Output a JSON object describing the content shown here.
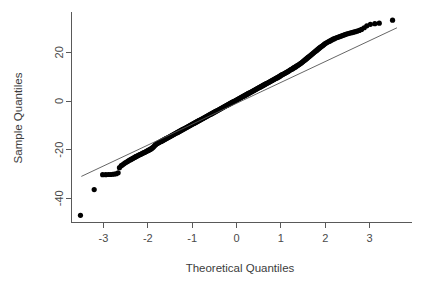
{
  "figure": {
    "kind": "normal-qq-plot",
    "width": 427,
    "height": 289,
    "background": "#ffffff",
    "point_color": "#000000",
    "line_color": "#555555",
    "axis_color": "#595959",
    "text_color": "#3c3c3c"
  },
  "chart_data": {
    "type": "scatter",
    "title": "",
    "subtitle": "",
    "xlabel": "Theoretical Quantiles",
    "ylabel": "Sample Quantiles",
    "xlim": [
      -3.85,
      3.95
    ],
    "ylim": [
      -50.5,
      36.5
    ],
    "xticks": [
      -3,
      -2,
      -1,
      0,
      1,
      2,
      3
    ],
    "xticklabels": [
      "-3",
      "-2",
      "-1",
      "0",
      "1",
      "2",
      "3"
    ],
    "yticks": [
      20,
      0,
      -20,
      -40
    ],
    "yticklabels": [
      "20",
      "0",
      "-20",
      "-40"
    ],
    "grid": false,
    "legend": null,
    "annotations": [],
    "reference_line": {
      "name": "qqline",
      "x": [
        -3.5,
        3.62
      ],
      "y": [
        -31.0,
        30.1
      ],
      "slope": 8.58,
      "intercept": -1.0,
      "style": "solid-thin"
    },
    "series": [
      {
        "name": "Sample quantiles vs theoretical quantiles",
        "marker": "filled-circle",
        "marker_size": 2.6,
        "x": [
          -3.52,
          -3.21,
          -3.02,
          -2.95,
          -2.89,
          -2.84,
          -2.79,
          -2.75,
          -2.71,
          -2.67,
          -2.64,
          -2.6,
          -2.57,
          -2.54,
          -2.51,
          -2.48,
          -2.45,
          -2.43,
          -2.4,
          -2.38,
          -2.35,
          -2.33,
          -2.3,
          -2.28,
          -2.26,
          -2.24,
          -2.22,
          -2.2,
          -2.18,
          -2.16,
          -2.14,
          -2.12,
          -2.1,
          -2.08,
          -2.06,
          -2.04,
          -2.02,
          -2.0,
          -1.98,
          -1.96,
          -1.94,
          -1.92,
          -1.9,
          -1.88,
          -1.86,
          -1.84,
          -1.82,
          -1.8,
          -1.78,
          -1.76,
          -1.74,
          -1.72,
          -1.7,
          -1.68,
          -1.66,
          -1.64,
          -1.62,
          -1.6,
          -1.58,
          -1.56,
          -1.54,
          -1.52,
          -1.5,
          -1.48,
          -1.46,
          -1.44,
          -1.42,
          -1.4,
          -1.38,
          -1.36,
          -1.34,
          -1.32,
          -1.3,
          -1.28,
          -1.26,
          -1.24,
          -1.22,
          -1.2,
          -1.18,
          -1.16,
          -1.14,
          -1.12,
          -1.1,
          -1.08,
          -1.06,
          -1.04,
          -1.02,
          -1.0,
          -0.98,
          -0.96,
          -0.94,
          -0.92,
          -0.9,
          -0.88,
          -0.86,
          -0.84,
          -0.82,
          -0.8,
          -0.78,
          -0.76,
          -0.74,
          -0.72,
          -0.7,
          -0.68,
          -0.66,
          -0.64,
          -0.62,
          -0.6,
          -0.58,
          -0.56,
          -0.54,
          -0.52,
          -0.5,
          -0.48,
          -0.46,
          -0.44,
          -0.42,
          -0.4,
          -0.38,
          -0.36,
          -0.34,
          -0.32,
          -0.3,
          -0.28,
          -0.26,
          -0.24,
          -0.22,
          -0.2,
          -0.18,
          -0.16,
          -0.14,
          -0.12,
          -0.1,
          -0.08,
          -0.06,
          -0.04,
          -0.02,
          0.0,
          0.02,
          0.04,
          0.06,
          0.08,
          0.1,
          0.12,
          0.14,
          0.16,
          0.18,
          0.2,
          0.22,
          0.24,
          0.26,
          0.28,
          0.3,
          0.32,
          0.34,
          0.36,
          0.38,
          0.4,
          0.42,
          0.44,
          0.46,
          0.48,
          0.5,
          0.52,
          0.54,
          0.56,
          0.58,
          0.6,
          0.62,
          0.64,
          0.66,
          0.68,
          0.7,
          0.72,
          0.74,
          0.76,
          0.78,
          0.8,
          0.82,
          0.84,
          0.86,
          0.88,
          0.9,
          0.92,
          0.94,
          0.96,
          0.98,
          1.0,
          1.02,
          1.04,
          1.06,
          1.08,
          1.1,
          1.12,
          1.14,
          1.16,
          1.18,
          1.2,
          1.22,
          1.24,
          1.26,
          1.28,
          1.3,
          1.32,
          1.34,
          1.36,
          1.38,
          1.4,
          1.42,
          1.44,
          1.46,
          1.48,
          1.5,
          1.52,
          1.54,
          1.56,
          1.58,
          1.6,
          1.62,
          1.64,
          1.66,
          1.68,
          1.7,
          1.72,
          1.74,
          1.76,
          1.78,
          1.8,
          1.82,
          1.84,
          1.86,
          1.88,
          1.9,
          1.92,
          1.94,
          1.96,
          1.98,
          2.0,
          2.03,
          2.06,
          2.09,
          2.12,
          2.15,
          2.18,
          2.21,
          2.24,
          2.27,
          2.3,
          2.33,
          2.36,
          2.39,
          2.42,
          2.45,
          2.48,
          2.52,
          2.56,
          2.6,
          2.64,
          2.68,
          2.72,
          2.77,
          2.82,
          2.88,
          2.94,
          3.02,
          3.12,
          3.22,
          3.52
        ],
        "y": [
          -47.0,
          -36.4,
          -30.3,
          -30.3,
          -30.2,
          -30.2,
          -30.1,
          -30.0,
          -29.9,
          -29.5,
          -27.4,
          -26.6,
          -26.2,
          -25.8,
          -25.4,
          -25.1,
          -24.8,
          -24.5,
          -24.2,
          -24.0,
          -23.7,
          -23.5,
          -23.2,
          -23.0,
          -22.8,
          -22.6,
          -22.4,
          -22.2,
          -22.0,
          -21.9,
          -21.7,
          -21.5,
          -21.3,
          -21.2,
          -21.0,
          -20.8,
          -20.6,
          -20.4,
          -20.2,
          -20.0,
          -19.8,
          -19.6,
          -19.3,
          -19.0,
          -18.6,
          -18.2,
          -17.9,
          -17.6,
          -17.4,
          -17.2,
          -17.0,
          -16.8,
          -16.6,
          -16.4,
          -16.2,
          -16.0,
          -15.8,
          -15.6,
          -15.4,
          -15.2,
          -15.0,
          -14.8,
          -14.6,
          -14.4,
          -14.2,
          -14.0,
          -13.8,
          -13.6,
          -13.4,
          -13.2,
          -13.0,
          -12.8,
          -12.6,
          -12.4,
          -12.2,
          -12.0,
          -11.8,
          -11.6,
          -11.4,
          -11.2,
          -11.0,
          -10.8,
          -10.6,
          -10.4,
          -10.2,
          -10.0,
          -9.8,
          -9.6,
          -9.4,
          -9.2,
          -9.0,
          -8.8,
          -8.6,
          -8.4,
          -8.2,
          -8.0,
          -7.8,
          -7.6,
          -7.4,
          -7.2,
          -7.0,
          -6.8,
          -6.6,
          -6.4,
          -6.2,
          -6.0,
          -5.8,
          -5.6,
          -5.4,
          -5.2,
          -5.0,
          -4.8,
          -4.6,
          -4.4,
          -4.2,
          -4.0,
          -3.8,
          -3.6,
          -3.4,
          -3.2,
          -3.0,
          -2.8,
          -2.6,
          -2.4,
          -2.2,
          -2.0,
          -1.8,
          -1.6,
          -1.4,
          -1.2,
          -1.0,
          -0.8,
          -0.6,
          -0.4,
          -0.2,
          0.0,
          0.2,
          0.4,
          0.6,
          0.8,
          1.0,
          1.2,
          1.4,
          1.6,
          1.8,
          2.0,
          2.2,
          2.4,
          2.6,
          2.8,
          3.0,
          3.2,
          3.4,
          3.6,
          3.8,
          4.0,
          4.2,
          4.4,
          4.6,
          4.8,
          5.0,
          5.2,
          5.4,
          5.6,
          5.8,
          6.0,
          6.2,
          6.4,
          6.6,
          6.8,
          7.0,
          7.2,
          7.4,
          7.6,
          7.8,
          8.0,
          8.2,
          8.4,
          8.6,
          8.8,
          9.0,
          9.2,
          9.4,
          9.6,
          9.8,
          10.0,
          10.2,
          10.5,
          10.7,
          10.9,
          11.1,
          11.3,
          11.5,
          11.7,
          11.9,
          12.1,
          12.3,
          12.6,
          12.8,
          13.0,
          13.2,
          13.5,
          13.7,
          13.9,
          14.1,
          14.4,
          14.6,
          14.9,
          15.1,
          15.4,
          15.6,
          15.9,
          16.2,
          16.5,
          16.8,
          17.1,
          17.4,
          17.7,
          18.0,
          18.3,
          18.6,
          18.9,
          19.2,
          19.5,
          19.8,
          20.1,
          20.4,
          20.7,
          21.0,
          21.3,
          21.6,
          21.9,
          22.2,
          22.5,
          22.7,
          23.0,
          23.3,
          23.6,
          23.9,
          24.2,
          24.5,
          24.8,
          25.1,
          25.4,
          25.6,
          25.9,
          26.1,
          26.3,
          26.5,
          26.7,
          26.9,
          27.1,
          27.3,
          27.5,
          27.7,
          27.9,
          28.1,
          28.3,
          28.5,
          28.7,
          29.0,
          29.4,
          30.1,
          30.9,
          31.5,
          31.8,
          32.0,
          33.2
        ]
      }
    ]
  },
  "axes": {
    "x_axis_name": "theoretical-quantiles-axis",
    "y_axis_name": "sample-quantiles-axis"
  }
}
